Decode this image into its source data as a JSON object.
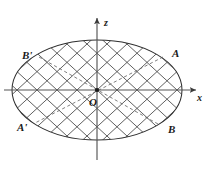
{
  "figure": {
    "caption": "Ellipse with two families of ruling lines, coordinate axes x and z, origin O, and four marked points A, B, A', B'",
    "background_color": "#ffffff",
    "stroke_color": "#3a3a3a",
    "axis_color": "#555555",
    "dashed_color": "#6a6a6a",
    "label_color": "#1a1a1a"
  },
  "axes": {
    "x_label": "x",
    "z_label": "z",
    "origin_label": "O"
  },
  "points": {
    "A": "A",
    "B": "B",
    "A_prime": "A'",
    "B_prime": "B'"
  },
  "chart_data": {
    "type": "diagram",
    "title": "",
    "xlabel": "x",
    "ylabel": "z",
    "ellipse": {
      "cx": 97,
      "cy": 90,
      "rx": 85,
      "ry": 50
    },
    "axis_x": {
      "x1": 4,
      "y1": 90,
      "x2": 201,
      "y2": 90,
      "arrow": "right"
    },
    "axis_z": {
      "x1": 97,
      "y1": 160,
      "x2": 97,
      "y2": 12,
      "arrow": "up"
    },
    "marked_points": [
      {
        "name": "A",
        "x": 163,
        "y": 57,
        "label_dx": 7,
        "label_dy": -4
      },
      {
        "name": "B",
        "x": 158,
        "y": 124,
        "label_dx": 7,
        "label_dy": 6
      },
      {
        "name": "A'",
        "x": 35,
        "y": 123,
        "label_dx": -18,
        "label_dy": 5
      },
      {
        "name": "B'",
        "x": 39,
        "y": 57,
        "label_dx": -18,
        "label_dy": -4
      }
    ],
    "dashed_chords": [
      {
        "from": "A",
        "to": "A'"
      },
      {
        "from": "B",
        "to": "B'"
      }
    ],
    "ruling_lines": {
      "family_1_slope": 0.92,
      "family_2_slope": -0.92,
      "count_per_family": 9,
      "spacing_px": 20
    },
    "grid": false,
    "legend": "none"
  }
}
